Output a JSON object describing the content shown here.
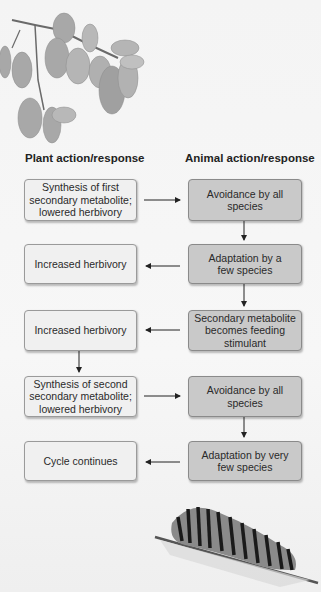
{
  "headers": {
    "plant": "Plant action/response",
    "animal": "Animal action/response"
  },
  "plant_boxes": [
    {
      "text": "Synthesis of first secondary metabolite; lowered herbivory"
    },
    {
      "text": "Increased herbivory"
    },
    {
      "text": "Increased herbivory"
    },
    {
      "text": "Synthesis of second secondary metabolite; lowered herbivory"
    },
    {
      "text": "Cycle continues"
    }
  ],
  "animal_boxes": [
    {
      "text": "Avoidance by all species"
    },
    {
      "text": "Adaptation by a few species"
    },
    {
      "text": "Secondary metabolite becomes feeding stimulant"
    },
    {
      "text": "Avoidance by all species"
    },
    {
      "text": "Adaptation by very few species"
    }
  ],
  "illustrations": {
    "top": "leafy-branch",
    "bottom": "caterpillar-on-twig"
  },
  "colors": {
    "plant_box": "#f0f0f0",
    "animal_box": "#c9c9c9",
    "arrow": "#222222"
  }
}
